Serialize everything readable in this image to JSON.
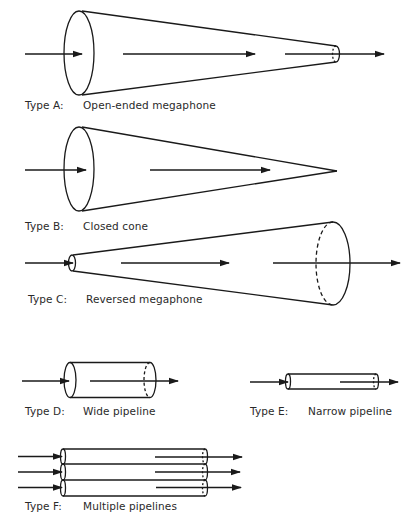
{
  "diagram": {
    "stroke_color": "#1a1a1a",
    "background": "#ffffff",
    "shapes": [
      {
        "id": "A",
        "type_label": "Type A:",
        "name": "Open-ended megaphone"
      },
      {
        "id": "B",
        "type_label": "Type B:",
        "name": "Closed cone"
      },
      {
        "id": "C",
        "type_label": "Type C:",
        "name": "Reversed megaphone"
      },
      {
        "id": "D",
        "type_label": "Type D:",
        "name": "Wide pipeline"
      },
      {
        "id": "E",
        "type_label": "Type E:",
        "name": "Narrow pipeline"
      },
      {
        "id": "F",
        "type_label": "Type F:",
        "name": "Multiple pipelines"
      }
    ]
  }
}
